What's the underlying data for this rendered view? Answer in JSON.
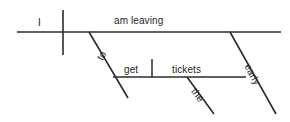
{
  "diagram": {
    "type": "reed-kellogg-sentence-diagram",
    "sentence": "I am leaving to get the tickets early",
    "ink_color": "#2b2b2b",
    "background_color": "#ffffff",
    "words": {
      "subject": "I",
      "verb": "am leaving",
      "infinitive_marker": "to",
      "infinitive_verb": "get",
      "object": "tickets",
      "article": "the",
      "adverb": "early"
    },
    "labels": [
      {
        "id": "subject",
        "text": "I",
        "x": 38,
        "y": 17,
        "rotation": 0
      },
      {
        "id": "verb",
        "text": "am leaving",
        "x": 114,
        "y": 15,
        "rotation": 0
      },
      {
        "id": "infinitive-marker",
        "text": "to",
        "x": 104,
        "y": 62,
        "rotation": -59
      },
      {
        "id": "infinitive-verb",
        "text": "get",
        "x": 124,
        "y": 64,
        "rotation": 0
      },
      {
        "id": "object",
        "text": "tickets",
        "x": 172,
        "y": 64,
        "rotation": 0
      },
      {
        "id": "article",
        "text": "the",
        "x": 198,
        "y": 86,
        "rotation": 54
      },
      {
        "id": "adverb",
        "text": "early",
        "x": 252,
        "y": 62,
        "rotation": 61
      }
    ],
    "lines": [
      {
        "id": "baseline-main",
        "kind": "horizontal",
        "x1": 17,
        "y1": 32,
        "x2": 281,
        "y2": 32
      },
      {
        "id": "subject-verb-divider",
        "kind": "vertical",
        "x1": 63,
        "y1": 10,
        "x2": 63,
        "y2": 55
      },
      {
        "id": "infinitive-slant",
        "kind": "diagonal",
        "x1": 89,
        "y1": 32,
        "x2": 128,
        "y2": 98
      },
      {
        "id": "infinitive-baseline",
        "kind": "horizontal",
        "x1": 113,
        "y1": 77,
        "x2": 246,
        "y2": 77
      },
      {
        "id": "verb-object-divider",
        "kind": "vertical",
        "x1": 152,
        "y1": 59,
        "x2": 152,
        "y2": 77
      },
      {
        "id": "article-slant",
        "kind": "diagonal",
        "x1": 187,
        "y1": 77,
        "x2": 214,
        "y2": 114
      },
      {
        "id": "adverb-slant",
        "kind": "diagonal",
        "x1": 230,
        "y1": 32,
        "x2": 276,
        "y2": 114
      }
    ]
  }
}
